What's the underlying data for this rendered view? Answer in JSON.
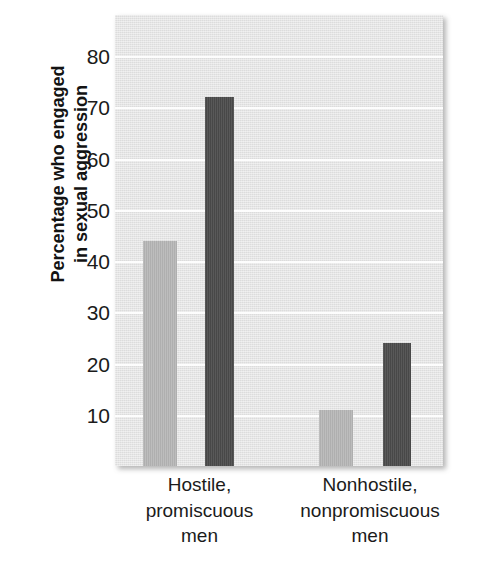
{
  "chart_data": {
    "type": "bar",
    "title": "",
    "xlabel": "",
    "ylabel": "Percentage who engaged in sexual aggression",
    "ylabel_lines": [
      "Percentage who engaged",
      "in sexual aggression"
    ],
    "categories": [
      "Hostile, promiscuous men",
      "Nonhostile, nonpromiscuous men"
    ],
    "category_lines": [
      [
        "Hostile,",
        "promiscuous",
        "men"
      ],
      [
        "Nonhostile,",
        "nonpromiscuous",
        "men"
      ]
    ],
    "series": [
      {
        "name": "light-bar-series",
        "color": "#b8b8b8",
        "values": [
          44,
          11
        ]
      },
      {
        "name": "dark-bar-series",
        "color": "#4c4c4c",
        "values": [
          72,
          24
        ]
      }
    ],
    "ylim": [
      0,
      88
    ],
    "yticks": [
      10,
      20,
      30,
      40,
      50,
      60,
      70,
      80
    ],
    "ytick_labels": [
      "10",
      "20",
      "30",
      "40",
      "50",
      "60",
      "70",
      "80"
    ],
    "grid": true,
    "gridline_color": "#fdfdfd",
    "legend": "none",
    "plot_background": "#e2e2e2"
  },
  "figure": {
    "background": "#ffffff"
  }
}
